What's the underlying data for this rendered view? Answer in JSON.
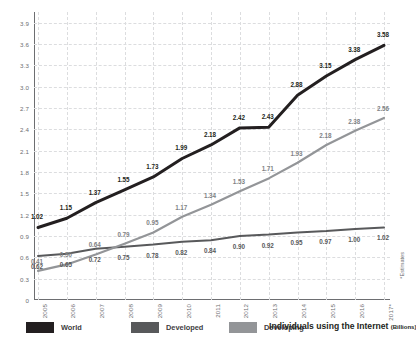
{
  "chart_data": {
    "type": "line",
    "title": "Individuals using the Internet",
    "unit": "(Billions)",
    "xlabel": "",
    "ylabel": "",
    "ylim": [
      0,
      4.05
    ],
    "grid": true,
    "legend_position": "bottom",
    "footnote": "*Estimates",
    "categories": [
      "2005",
      "2006",
      "2007",
      "2008",
      "2009",
      "2010",
      "2011",
      "2012",
      "2013",
      "2014",
      "2015",
      "2016",
      "2017*"
    ],
    "series": [
      {
        "name": "World",
        "color": "#231f20",
        "values": [
          1.02,
          1.15,
          1.37,
          1.55,
          1.73,
          1.99,
          2.18,
          2.42,
          2.43,
          2.88,
          3.15,
          3.38,
          3.58
        ]
      },
      {
        "name": "Developed",
        "color": "#58595b",
        "values": [
          0.62,
          0.65,
          0.72,
          0.75,
          0.78,
          0.82,
          0.84,
          0.9,
          0.92,
          0.95,
          0.97,
          1.0,
          1.02
        ]
      },
      {
        "name": "Developing",
        "color": "#939598",
        "values": [
          0.41,
          0.5,
          0.64,
          0.79,
          0.95,
          1.17,
          1.34,
          1.53,
          1.71,
          1.93,
          2.18,
          2.38,
          2.56
        ]
      }
    ],
    "yticks": [
      "0",
      "0.3",
      "0.6",
      "0.9",
      "1.2",
      "1.5",
      "1.8",
      "2.1",
      "2.4",
      "2.7",
      "3.0",
      "3.3",
      "3.6",
      "3.9"
    ],
    "ytick_values": [
      0,
      0.3,
      0.6,
      0.9,
      1.2,
      1.5,
      1.8,
      2.1,
      2.4,
      2.7,
      3.0,
      3.3,
      3.6,
      3.9
    ]
  }
}
